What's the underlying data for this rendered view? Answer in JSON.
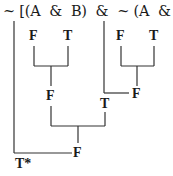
{
  "formula": "~ [(A  &  B)  &  ~ (A  &  B)]",
  "values": {
    "a1": "F",
    "b1": "T",
    "a2": "F",
    "b2": "T",
    "conj1": "F",
    "conj2": "F",
    "neg2": "T",
    "main_conj": "F",
    "result": "T*"
  }
}
